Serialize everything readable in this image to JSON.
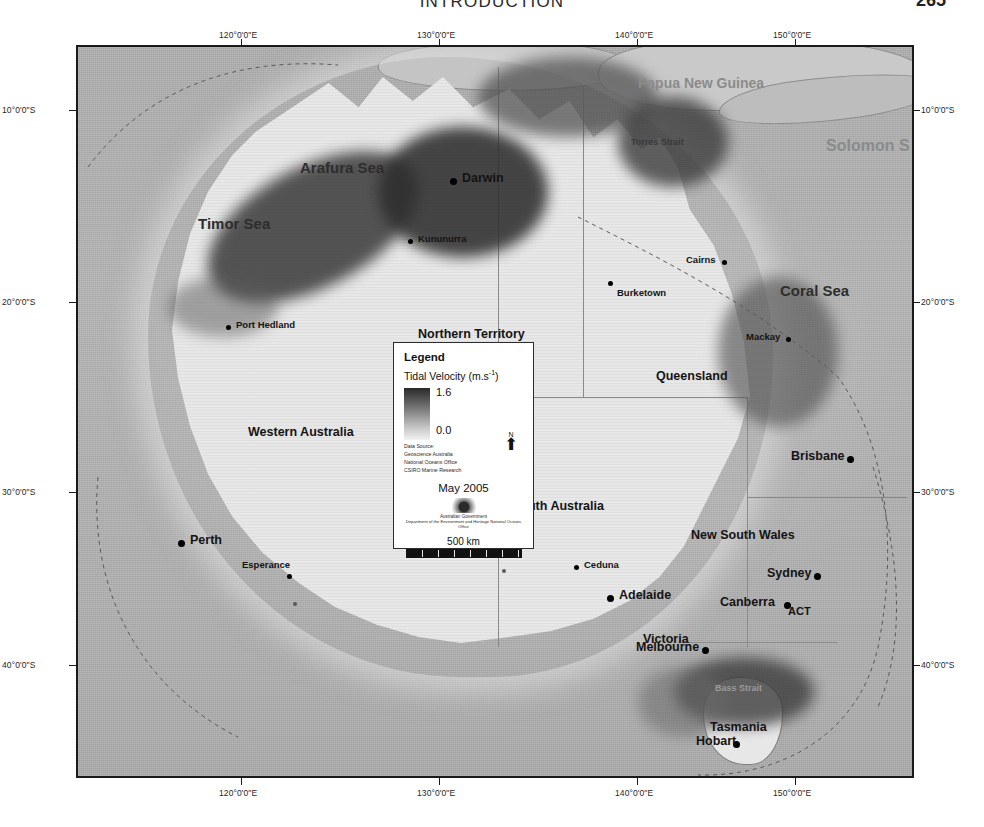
{
  "page": {
    "running_head": "INTRODUCTION",
    "page_number": "265"
  },
  "map": {
    "graticule": {
      "longitude_labels": [
        "120°0'0\"E",
        "130°0'0\"E",
        "140°0'0\"E",
        "150°0'0\"E"
      ],
      "latitude_labels": [
        "10°0'0\"S",
        "20°0'0\"S",
        "30°0'0\"S",
        "40°0'0\"S"
      ]
    },
    "cities": [
      {
        "name": "Darwin",
        "size": "large"
      },
      {
        "name": "Kununurra",
        "size": "small"
      },
      {
        "name": "Port Hedland",
        "size": "small"
      },
      {
        "name": "Perth",
        "size": "large"
      },
      {
        "name": "Esperance",
        "size": "small"
      },
      {
        "name": "Ceduna",
        "size": "small"
      },
      {
        "name": "Adelaide",
        "size": "large"
      },
      {
        "name": "Melbourne",
        "size": "large"
      },
      {
        "name": "Hobart",
        "size": "large"
      },
      {
        "name": "Canberra",
        "size": "large"
      },
      {
        "name": "Sydney",
        "size": "large"
      },
      {
        "name": "Brisbane",
        "size": "large"
      },
      {
        "name": "Mackay",
        "size": "small"
      },
      {
        "name": "Cairns",
        "size": "small"
      },
      {
        "name": "Burketown",
        "size": "small"
      }
    ],
    "states": [
      "Western Australia",
      "Northern Territory",
      "Queensland",
      "South Australia",
      "New South Wales",
      "Victoria",
      "Tasmania",
      "ACT"
    ],
    "seas": [
      "Arafura Sea",
      "Timor Sea",
      "Coral Sea",
      "Torres Strait",
      "Bass Strait"
    ],
    "countries": [
      "Papua New Guinea",
      "Solomon S",
      "Australia"
    ]
  },
  "legend": {
    "title": "Legend",
    "subtitle_text": "Tidal Velocity (m.s",
    "subtitle_exponent": "-1",
    "subtitle_close": ")",
    "ramp_max": "1.6",
    "ramp_min": "0.0",
    "source_lines": [
      "Data Source:",
      "Geoscience Australia",
      "National Oceans Office",
      "CSIRO Marine Research"
    ],
    "north_letter": "N",
    "north_arrow_glyph": "⬆",
    "date": "May 2005",
    "gov_line1": "Australian Government",
    "gov_line2": "Department of the Environment and Heritage\nNational Oceans Office",
    "scale_label": "500 km",
    "colors": {
      "ramp_high": "#2a2a2a",
      "ramp_low": "#f2f2f2",
      "ocean": "#a9a9a9",
      "land": "#e7e7e7",
      "frame": "#1a1a1a"
    }
  }
}
